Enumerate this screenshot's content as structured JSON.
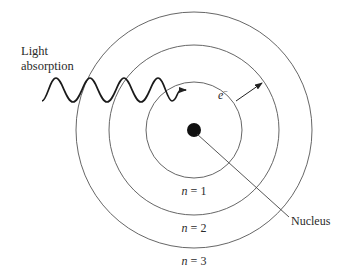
{
  "diagram": {
    "labels": {
      "light_line1": "Light",
      "light_line2": "absorption",
      "electron": "e",
      "electron_charge": "−",
      "nucleus": "Nucleus"
    },
    "orbits": [
      {
        "n_label": "n",
        "eq": " = 1"
      },
      {
        "n_label": "n",
        "eq": " = 2"
      },
      {
        "n_label": "n",
        "eq": " = 3"
      }
    ],
    "colors": {
      "line": "#3a3a3a",
      "nucleus": "#111111",
      "text": "#2a2a2a"
    }
  }
}
